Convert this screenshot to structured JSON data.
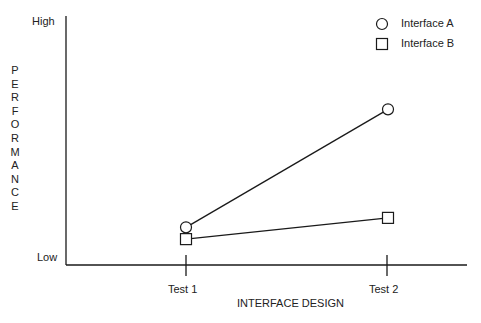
{
  "chart_data": {
    "type": "line",
    "title": "",
    "xlabel": "INTERFACE DESIGN",
    "ylabel": "PERFORMANCE",
    "categories": [
      "Test 1",
      "Test 2"
    ],
    "y_tick_labels": {
      "low": "Low",
      "high": "High"
    },
    "ylim": [
      0,
      100
    ],
    "grid": false,
    "legend_position": "top-right",
    "series": [
      {
        "name": "Interface A",
        "marker": "circle",
        "values": [
          13,
          63
        ]
      },
      {
        "name": "Interface B",
        "marker": "square",
        "values": [
          8,
          17
        ]
      }
    ]
  },
  "colors": {
    "line": "#1a1a1a",
    "background": "#ffffff"
  }
}
